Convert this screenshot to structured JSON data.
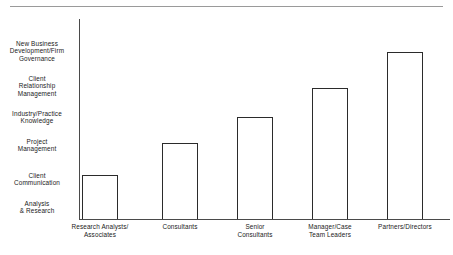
{
  "figure": {
    "top_rule_present": true,
    "ghost_title": ""
  },
  "chart_data": {
    "type": "bar",
    "title": "",
    "subtitle": "",
    "xlabel": "",
    "ylabel": "",
    "categories": [
      "Research Analysts/\nAssociates",
      "Consultants",
      "Senior\nConsultants",
      "Manager/Case\nTeam Leaders",
      "Partners/Directors"
    ],
    "category_lines": [
      [
        "Research Analysts/",
        "Associates"
      ],
      [
        "Consultants"
      ],
      [
        "Senior",
        "Consultants"
      ],
      [
        "Manager/Case",
        "Team Leaders"
      ],
      [
        "Partners/Directors"
      ]
    ],
    "y_tick_labels": [
      "Analysis\n& Research",
      "Client\nCommunication",
      "Project\nManagement",
      "Industry/Practice\nKnowledge",
      "Client\nRelationship\nManagement",
      "New Business\nDevelopment/Firm\nGovernance"
    ],
    "y_tick_label_lines": [
      [
        "Analysis",
        "& Research"
      ],
      [
        "Client",
        "Communication"
      ],
      [
        "Project",
        "Management"
      ],
      [
        "Industry/Practice",
        "Knowledge"
      ],
      [
        "Client",
        "Relationship",
        "Management"
      ],
      [
        "New Business",
        "Development/Firm",
        "Governance"
      ]
    ],
    "y_tick_values": [
      1,
      2,
      3,
      4,
      5,
      6
    ],
    "values": [
      1.3,
      2.5,
      3.5,
      4.5,
      5.5
    ],
    "ylim": [
      0,
      6.35
    ],
    "grid": false,
    "legend": null,
    "bar_fill": "#ffffff",
    "bar_edge": "#2b2b2b",
    "axis_color": "#4a4a4a",
    "background": "#ffffff"
  },
  "geometry": {
    "plot_left": 79,
    "plot_baseline": 219,
    "plot_top": 19,
    "plot_right": 450,
    "bars": [
      {
        "left": 82,
        "width": 36,
        "top": 175
      },
      {
        "left": 162,
        "width": 36,
        "top": 143
      },
      {
        "left": 237,
        "width": 36,
        "top": 117
      },
      {
        "left": 312,
        "width": 36,
        "top": 88
      },
      {
        "left": 387,
        "width": 36,
        "top": 52
      }
    ],
    "y_label_centers": [
      207,
      179,
      145,
      117,
      86,
      51
    ],
    "x_label_centers": [
      100,
      180,
      255,
      330,
      405
    ]
  }
}
